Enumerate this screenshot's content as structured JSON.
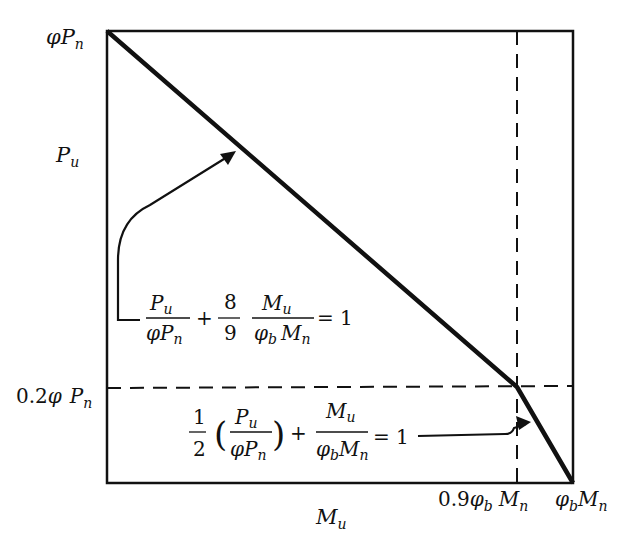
{
  "diagram": {
    "type": "interaction diagram",
    "y_axis": {
      "top_label": "φP",
      "top_label_sub": "n",
      "mid_label": "P",
      "mid_label_sub": "u",
      "break_label_num": "0.2",
      "break_label_phi": "φ",
      "break_label_P": "P",
      "break_label_sub": "n"
    },
    "x_axis": {
      "mid_label": "M",
      "mid_label_sub": "u",
      "break_label_num": "0.9",
      "break_label_phi": "φ",
      "break_label_phi_sub": "b",
      "break_label_M": "M",
      "break_label_M_sub": "n",
      "end_label_phi": "φ",
      "end_label_phi_sub": "b",
      "end_label_M": "M",
      "end_label_M_sub": "n"
    },
    "equation_upper": {
      "frac1_num": "P",
      "frac1_num_sub": "u",
      "frac1_den": "φP",
      "frac1_den_sub": "n",
      "plus": "+",
      "coef_num": "8",
      "coef_den": "9",
      "frac2_num": "M",
      "frac2_num_sub": "u",
      "frac2_den_phi": "φ",
      "frac2_den_phi_sub": "b",
      "frac2_den_M": "M",
      "frac2_den_M_sub": "n",
      "equals": "= 1"
    },
    "equation_lower": {
      "half_num": "1",
      "half_den": "2",
      "lparen": "(",
      "rparen": ")",
      "frac1_num": "P",
      "frac1_num_sub": "u",
      "frac1_den": "φP",
      "frac1_den_sub": "n",
      "plus": "+",
      "frac2_num": "M",
      "frac2_num_sub": "u",
      "frac2_den_phi": "φ",
      "frac2_den_phi_sub": "b",
      "frac2_den_M": "M",
      "frac2_den_M_sub": "n",
      "equals": "= 1"
    },
    "colors": {
      "ink": "#111111",
      "background": "#ffffff"
    }
  }
}
